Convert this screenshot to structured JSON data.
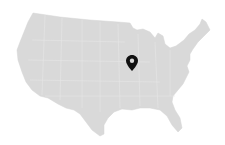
{
  "map": {
    "region": "Contiguous United States",
    "fill_color": "#d9d9d9",
    "border_color": "#e8e8e8",
    "background_color": "#ffffff"
  },
  "markers": [
    {
      "icon": "map-pin-icon",
      "x": 132,
      "y": 64,
      "color": "#111111"
    }
  ]
}
